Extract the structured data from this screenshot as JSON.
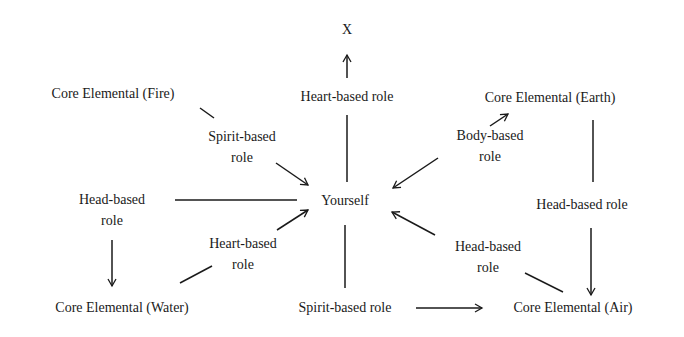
{
  "diagram": {
    "nodes": {
      "x": {
        "label": "X"
      },
      "heart_top": {
        "line1": "Heart-based role"
      },
      "fire": {
        "label": "Core Elemental (Fire)"
      },
      "earth": {
        "label": "Core Elemental (Earth)"
      },
      "spirit_left": {
        "line1": "Spirit-based",
        "line2": "role"
      },
      "body": {
        "line1": "Body-based",
        "line2": "role"
      },
      "yourself": {
        "label": "Yourself"
      },
      "head_left": {
        "line1": "Head-based",
        "line2": "role"
      },
      "head_right": {
        "line1": "Head-based role"
      },
      "heart_left": {
        "line1": "Heart-based",
        "line2": "role"
      },
      "head_lower_right": {
        "line1": "Head-based",
        "line2": "role"
      },
      "water": {
        "label": "Core Elemental (Water)"
      },
      "spirit_bottom": {
        "line1": "Spirit-based role"
      },
      "air": {
        "label": "Core Elemental (Air)"
      }
    },
    "edges": [
      {
        "from": "heart_top",
        "to": "x",
        "arrow": true
      },
      {
        "from": "yourself",
        "to": "heart_top",
        "arrow": false
      },
      {
        "from": "fire",
        "to": "spirit_left",
        "arrow": false
      },
      {
        "from": "spirit_left",
        "to": "yourself",
        "arrow": true
      },
      {
        "from": "body",
        "to": "earth",
        "arrow": true
      },
      {
        "from": "body",
        "to": "yourself",
        "arrow": true
      },
      {
        "from": "earth",
        "to": "head_right",
        "arrow": false
      },
      {
        "from": "head_right",
        "to": "air",
        "arrow": true
      },
      {
        "from": "head_left",
        "to": "yourself",
        "arrow": false
      },
      {
        "from": "head_left",
        "to": "water",
        "arrow": true
      },
      {
        "from": "water",
        "to": "heart_left",
        "arrow": false
      },
      {
        "from": "heart_left",
        "to": "yourself",
        "arrow": true
      },
      {
        "from": "yourself",
        "to": "spirit_bottom",
        "arrow": false
      },
      {
        "from": "spirit_bottom",
        "to": "air",
        "arrow": true
      },
      {
        "from": "air",
        "to": "head_lower_right",
        "arrow": false
      },
      {
        "from": "head_lower_right",
        "to": "yourself",
        "arrow": true
      }
    ]
  }
}
